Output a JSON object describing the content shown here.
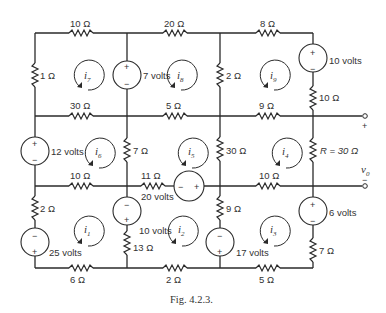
{
  "figure": {
    "caption": "Fig. 4.2.3.",
    "type": "circuit-diagram",
    "ink_color": "#2a2a2a"
  },
  "resistors": {
    "top_left": "10 Ω",
    "top_mid": "20 Ω",
    "top_right": "8 Ω",
    "left_upper": "1 Ω",
    "row2_left": "30 Ω",
    "row2_mid": "5 Ω",
    "row2_right": "9 Ω",
    "col3_upper": "2 Ω",
    "right_upper": "10 Ω",
    "col2_mid": "7 Ω",
    "col3_mid": "30 Ω",
    "load": "R = 30 Ω",
    "row3_left": "10 Ω",
    "row3_mid": "11 Ω",
    "row3_right": "10 Ω",
    "left_lower": "2 Ω",
    "col2_lower": "13 Ω",
    "col3_lower": "9 Ω",
    "right_lower": "7 Ω",
    "bottom_left": "6 Ω",
    "bottom_mid": "2 Ω",
    "bottom_right": "5 Ω"
  },
  "sources": {
    "v7": {
      "label": "7 volts",
      "plus": "+",
      "minus": "−"
    },
    "v10_top": {
      "label": "10 volts",
      "plus": "+",
      "minus": "−"
    },
    "v12": {
      "label": "12 volts",
      "plus": "+",
      "minus": "−"
    },
    "v20": {
      "label": "20 volts",
      "plus": "+",
      "minus": "−"
    },
    "v25": {
      "label": "25 volts",
      "plus": "+",
      "minus": "−"
    },
    "v10_mid": {
      "label": "10 volts",
      "plus": "+",
      "minus": "−"
    },
    "v17": {
      "label": "17 volts",
      "plus": "+",
      "minus": "−"
    },
    "v6": {
      "label": "6 volts",
      "plus": "+",
      "minus": "−"
    }
  },
  "currents": {
    "i1": {
      "base": "i",
      "sub": "1"
    },
    "i2": {
      "base": "i",
      "sub": "2"
    },
    "i3": {
      "base": "i",
      "sub": "3"
    },
    "i4": {
      "base": "i",
      "sub": "4"
    },
    "i5": {
      "base": "i",
      "sub": "5"
    },
    "i6": {
      "base": "i",
      "sub": "6"
    },
    "i7": {
      "base": "i",
      "sub": "7"
    },
    "i8": {
      "base": "i",
      "sub": "8"
    },
    "i9": {
      "base": "i",
      "sub": "9"
    }
  },
  "output": {
    "plus": "+",
    "minus": "−",
    "voltage_base": "v",
    "voltage_sub": "0"
  }
}
